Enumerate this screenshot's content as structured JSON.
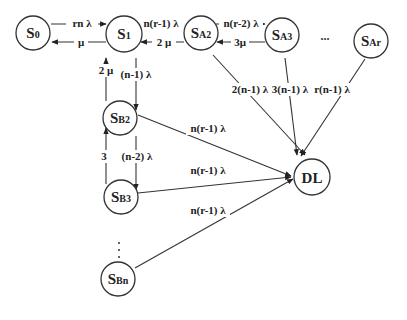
{
  "diagram": {
    "type": "state-transition-diagram",
    "nodes": {
      "s0": {
        "prefix": "S",
        "sub": "0"
      },
      "s1": {
        "prefix": "S",
        "sub": "1"
      },
      "sa2": {
        "prefix": "S",
        "sub": "A2"
      },
      "sa3": {
        "prefix": "S",
        "sub": "A3"
      },
      "sar": {
        "prefix": "S",
        "sub": "Ar"
      },
      "sb2": {
        "prefix": "S",
        "sub": "B2"
      },
      "sb3": {
        "prefix": "S",
        "sub": "B3"
      },
      "sbn": {
        "prefix": "S",
        "sub": "Bn"
      },
      "dl": {
        "label": "DL"
      }
    },
    "edges": {
      "s0_s1": {
        "from": "S0",
        "to": "S1",
        "label": "rn λ"
      },
      "s1_s0": {
        "from": "S1",
        "to": "S0",
        "label": "μ"
      },
      "s1_sa2": {
        "from": "S1",
        "to": "SA2",
        "label": "n(r-1) λ"
      },
      "sa2_s1": {
        "from": "SA2",
        "to": "S1",
        "label": "2 μ"
      },
      "sa2_sa3": {
        "from": "SA2",
        "to": "SA3",
        "label": "n(r-2) λ"
      },
      "sa3_sa2": {
        "from": "SA3",
        "to": "SA2",
        "label": "3μ"
      },
      "sb2_s1": {
        "from": "SB2",
        "to": "S1",
        "label": "2 μ"
      },
      "s1_sb2": {
        "from": "S1",
        "to": "SB2",
        "label": "(n-1) λ"
      },
      "sb3_sb2": {
        "from": "SB3",
        "to": "SB2",
        "label": "3"
      },
      "sb2_sb3": {
        "from": "SB2",
        "to": "SB3",
        "label": "(n-2) λ"
      },
      "sa2_dl": {
        "from": "SA2",
        "to": "DL",
        "label": "2(n-1) λ"
      },
      "sa3_dl": {
        "from": "SA3",
        "to": "DL",
        "label": "3(n-1) λ"
      },
      "sar_dl": {
        "from": "SAr",
        "to": "DL",
        "label": "r(n-1) λ"
      },
      "sb2_dl": {
        "from": "SB2",
        "to": "DL",
        "label": "n(r-1) λ"
      },
      "sb3_dl": {
        "from": "SB3",
        "to": "DL",
        "label": "n(r-1) λ"
      },
      "sbn_dl": {
        "from": "SBn",
        "to": "DL",
        "label": "n(r-1) λ"
      }
    },
    "ellipsis_horizontal": "...",
    "ellipsis_vertical": ":"
  }
}
